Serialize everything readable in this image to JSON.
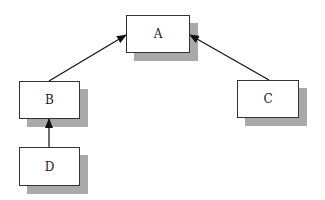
{
  "diagram": {
    "type": "tree",
    "nodes": [
      {
        "id": "A",
        "label": "A",
        "x": 126,
        "y": 15,
        "w": 64,
        "h": 38
      },
      {
        "id": "B",
        "label": "B",
        "x": 19,
        "y": 81,
        "w": 61,
        "h": 38
      },
      {
        "id": "C",
        "label": "C",
        "x": 237,
        "y": 80,
        "w": 62,
        "h": 38
      },
      {
        "id": "D",
        "label": "D",
        "x": 19,
        "y": 147,
        "w": 61,
        "h": 39
      }
    ],
    "edges": [
      {
        "from": "B",
        "to": "A"
      },
      {
        "from": "C",
        "to": "A"
      },
      {
        "from": "D",
        "to": "B"
      }
    ],
    "style": {
      "shadow_color": "#a9a9a9",
      "border_color": "#333333",
      "edge_color": "#111111",
      "shadow_offset": 8
    }
  }
}
